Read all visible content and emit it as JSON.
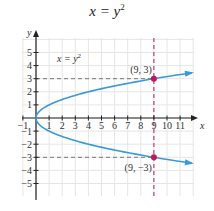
{
  "chart_data": {
    "type": "line",
    "xlabel": "x",
    "ylabel": "y",
    "xlim": [
      -1.5,
      12
    ],
    "ylim": [
      -6,
      6
    ],
    "grid": true,
    "x_ticks": [
      -1,
      1,
      2,
      3,
      4,
      5,
      6,
      7,
      8,
      9,
      10,
      11
    ],
    "y_ticks": [
      -5,
      -4,
      -3,
      -2,
      -1,
      1,
      2,
      3,
      4,
      5
    ],
    "series": [
      {
        "name": "x = y²",
        "color": "#3a9ad9",
        "equation": "x = y^2",
        "y_range": [
          -3.45,
          3.45
        ]
      }
    ],
    "points": [
      {
        "label": "(9, 3)",
        "x": 9,
        "y": 3,
        "color": "#c0185a"
      },
      {
        "label": "(9, −3)",
        "x": 9,
        "y": -3,
        "color": "#c0185a"
      }
    ],
    "guides": [
      {
        "type": "vertical",
        "x": 9,
        "color": "#c0185a",
        "style": "dashed"
      },
      {
        "type": "horizontal",
        "y": 3,
        "color": "#777777",
        "style": "dashed"
      },
      {
        "type": "horizontal",
        "y": -3,
        "color": "#777777",
        "style": "dashed"
      }
    ],
    "annotations": [
      {
        "text": "x = y²",
        "x": 2,
        "y": 4.3
      }
    ]
  },
  "labels": {
    "title_base": "x = y",
    "title_exp": "2",
    "curve_label_base": "x = y",
    "curve_label_exp": "2",
    "x_axis": "x",
    "y_axis": "y",
    "point_top": "(9, 3)",
    "point_bottom": "(9, −3)"
  }
}
